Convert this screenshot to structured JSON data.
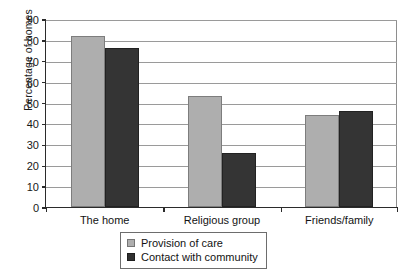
{
  "chart_data": {
    "type": "bar",
    "title": "",
    "xlabel": "",
    "ylabel": "Percentage of homes",
    "ylim": [
      0,
      90
    ],
    "ytick_step": 10,
    "yticks": [
      90,
      80,
      70,
      60,
      50,
      40,
      30,
      20,
      10,
      0
    ],
    "grid": true,
    "legend_position": "bottom-center",
    "categories": [
      "The home",
      "Religious group",
      "Friends/family"
    ],
    "series": [
      {
        "name": "Provision of care",
        "color": "#aeaeae",
        "values": [
          82,
          53,
          44
        ]
      },
      {
        "name": "Contact with community",
        "color": "#343434",
        "values": [
          76,
          26,
          46
        ]
      }
    ]
  },
  "legend": {
    "entries": [
      {
        "label": "Provision of care",
        "swatch": "light-gray-swatch-icon"
      },
      {
        "label": "Contact with community",
        "swatch": "dark-gray-swatch-icon"
      }
    ]
  }
}
